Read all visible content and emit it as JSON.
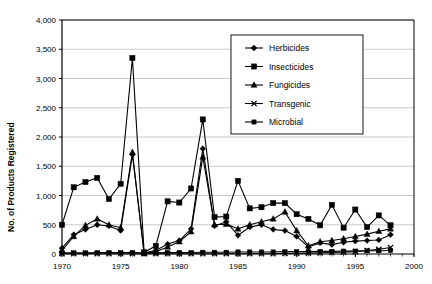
{
  "chart_data": {
    "type": "line",
    "title": "",
    "xlabel": "",
    "ylabel": "No. of Products Registered",
    "xlim": [
      1970,
      2000
    ],
    "ylim": [
      0,
      4000
    ],
    "ytick_labels": [
      "0",
      "500",
      "1,000",
      "1,500",
      "2,000",
      "2,500",
      "3,000",
      "3,500",
      "4,000"
    ],
    "ytick_values": [
      0,
      500,
      1000,
      1500,
      2000,
      2500,
      3000,
      3500,
      4000
    ],
    "xtick_labels": [
      "1970",
      "1975",
      "1980",
      "1985",
      "1990",
      "1995",
      "2000"
    ],
    "xtick_values": [
      1970,
      1975,
      1980,
      1985,
      1990,
      1995,
      2000
    ],
    "grid": "horizontal",
    "legend_position": "upper-center-right",
    "x": [
      1970,
      1971,
      1972,
      1973,
      1974,
      1975,
      1976,
      1977,
      1978,
      1979,
      1980,
      1981,
      1982,
      1983,
      1984,
      1985,
      1986,
      1987,
      1988,
      1989,
      1990,
      1991,
      1992,
      1993,
      1994,
      1995,
      1996,
      1997,
      1998
    ],
    "series": [
      {
        "name": "Herbicides",
        "marker": "diamond",
        "values": [
          100,
          330,
          420,
          500,
          480,
          400,
          1700,
          20,
          60,
          170,
          230,
          430,
          1800,
          480,
          550,
          320,
          460,
          500,
          420,
          400,
          300,
          120,
          190,
          160,
          200,
          220,
          230,
          240,
          330
        ]
      },
      {
        "name": "Insecticides",
        "marker": "square",
        "values": [
          500,
          1140,
          1230,
          1300,
          940,
          1200,
          3350,
          30,
          140,
          900,
          880,
          1120,
          2300,
          630,
          640,
          1250,
          780,
          800,
          870,
          870,
          680,
          600,
          490,
          840,
          450,
          760,
          460,
          660,
          490
        ]
      },
      {
        "name": "Fungicides",
        "marker": "triangle",
        "values": [
          60,
          300,
          490,
          600,
          500,
          450,
          1740,
          10,
          40,
          120,
          210,
          380,
          1660,
          500,
          510,
          430,
          500,
          550,
          600,
          720,
          400,
          140,
          210,
          230,
          260,
          300,
          340,
          390,
          430
        ]
      },
      {
        "name": "Transgenic",
        "marker": "cross",
        "values": [
          5,
          5,
          5,
          5,
          5,
          5,
          5,
          5,
          5,
          5,
          5,
          5,
          5,
          5,
          5,
          5,
          5,
          5,
          5,
          10,
          10,
          15,
          20,
          25,
          30,
          40,
          60,
          80,
          110
        ]
      },
      {
        "name": "Microbial",
        "marker": "square-small",
        "values": [
          20,
          20,
          20,
          25,
          25,
          25,
          25,
          20,
          20,
          25,
          25,
          25,
          30,
          30,
          30,
          35,
          35,
          35,
          35,
          40,
          40,
          40,
          45,
          45,
          50,
          50,
          55,
          55,
          60
        ]
      }
    ]
  },
  "axes": {
    "y_title": "No. of Products Registered"
  },
  "colors": {
    "line": "#000000",
    "grid": "#b3b3b3",
    "frame": "#000000",
    "background": "#ffffff"
  }
}
